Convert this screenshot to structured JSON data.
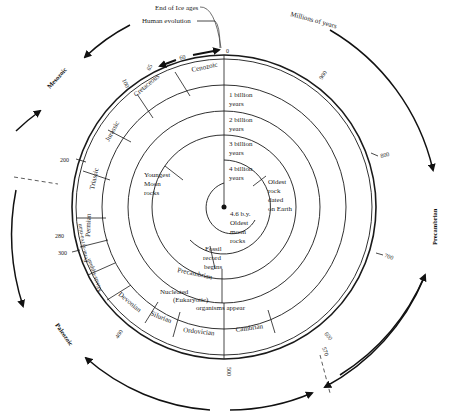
{
  "diagram": {
    "title_units": "Millions of years",
    "top_annotations": {
      "end_ice_ages": "End of Ice ages",
      "human_evolution": "Human evolution",
      "zero": "0",
      "sixty": "60",
      "sixtyfive": "65"
    },
    "eras": {
      "mesozoic": "Mesozoic",
      "paleozoic": "Paleozoic",
      "precambrian_outer": "Precambrian"
    },
    "periods": {
      "cenozoic": "Cenozoic",
      "cretaceous": "Cretaceous",
      "jurassic": "Jurassic",
      "triassic": "Triassic",
      "permian": "Permian",
      "pennsylvanian": "Penn-sylva-nian",
      "mississippian": "Missis-sippian",
      "devonian": "Devonian",
      "silurian": "Silurian",
      "ordovician": "Ordovician",
      "cambrian": "Cambrian"
    },
    "tick_labels": {
      "t100": "100",
      "t200": "200",
      "t280": "280",
      "t300": "300",
      "t400": "400",
      "t500": "500",
      "t570": "570",
      "t600": "600",
      "t700": "700",
      "t800": "800",
      "t900": "900"
    },
    "rings": {
      "one_billion": [
        "1 billion",
        "years"
      ],
      "two_billion": [
        "2 billion",
        "years"
      ],
      "three_billion": [
        "3 billion",
        "years"
      ],
      "four_billion": [
        "4 billion",
        "years"
      ]
    },
    "events": {
      "youngest_moon": [
        "Youngest",
        "Moon",
        "rocks"
      ],
      "oldest_rock": [
        "Oldest",
        "rock",
        "dated",
        "on Earth"
      ],
      "oldest_moon": [
        "4.6 b.y.",
        "Oldest",
        "moon",
        "rocks"
      ],
      "fossil_record": [
        "Fossil",
        "record",
        "begins"
      ],
      "precambrian_inner": "Precambrian",
      "eukaryotic": [
        "Nucleated",
        "(Eukaryotic)",
        "organisms appear"
      ]
    }
  }
}
